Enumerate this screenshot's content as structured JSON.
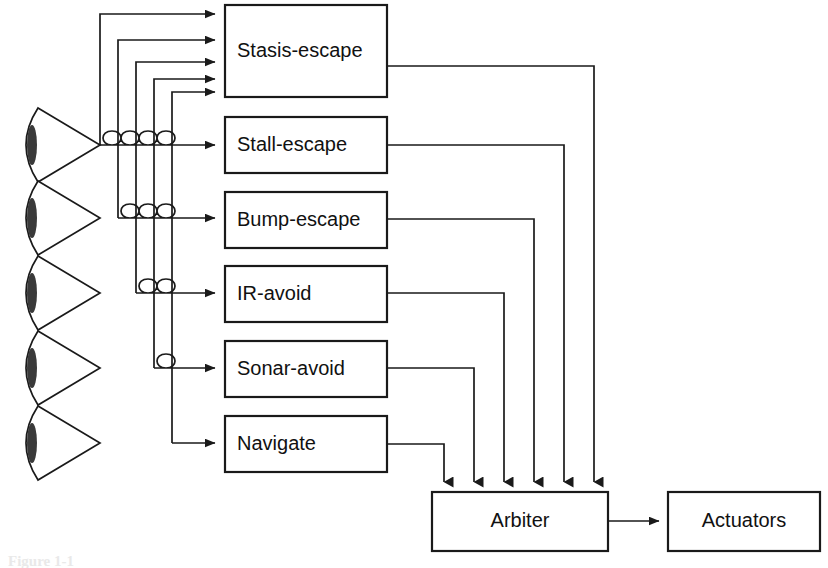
{
  "figure": {
    "background_color": "#ffffff",
    "line_color": "#1a1a1a",
    "text_color": "#111111",
    "width": 828,
    "height": 568
  },
  "behaviors": [
    {
      "id": "stasis-escape",
      "label": "Stasis-escape",
      "x": 225,
      "y": 5,
      "w": 162,
      "h": 92,
      "priority": 1
    },
    {
      "id": "stall-escape",
      "label": "Stall-escape",
      "x": 225,
      "y": 117,
      "w": 162,
      "h": 56,
      "priority": 2
    },
    {
      "id": "bump-escape",
      "label": "Bump-escape",
      "x": 225,
      "y": 192,
      "w": 162,
      "h": 56,
      "priority": 3
    },
    {
      "id": "ir-avoid",
      "label": "IR-avoid",
      "x": 225,
      "y": 266,
      "w": 162,
      "h": 56,
      "priority": 4
    },
    {
      "id": "sonar-avoid",
      "label": "Sonar-avoid",
      "x": 225,
      "y": 341,
      "w": 162,
      "h": 56,
      "priority": 5
    },
    {
      "id": "navigate",
      "label": "Navigate",
      "x": 225,
      "y": 416,
      "w": 162,
      "h": 56,
      "priority": 6
    }
  ],
  "arbiter": {
    "label": "Arbiter",
    "x": 432,
    "y": 492,
    "w": 176,
    "h": 59,
    "input_count": 6,
    "input_arrow_x": [
      444,
      474,
      504,
      534,
      564,
      594
    ]
  },
  "actuators": {
    "label": "Actuators",
    "x": 668,
    "y": 492,
    "w": 152,
    "h": 59
  },
  "sensors": [
    {
      "id": "sensor-1",
      "apex_y": 145,
      "feeds": "stall-escape"
    },
    {
      "id": "sensor-2",
      "apex_y": 218,
      "feeds": "bump-escape"
    },
    {
      "id": "sensor-3",
      "apex_y": 293,
      "feeds": "ir-avoid"
    },
    {
      "id": "sensor-4",
      "apex_y": 368,
      "feeds": "sonar-avoid"
    },
    {
      "id": "sensor-5",
      "apex_y": 443,
      "feeds": "navigate"
    }
  ],
  "sensor_bus": {
    "riser_x": [
      100,
      118,
      136,
      154,
      172
    ],
    "stasis_entry_y": [
      14,
      40,
      62,
      79,
      92
    ]
  },
  "output_bus": {
    "drop_x": [
      594,
      564,
      534,
      504,
      474,
      444
    ],
    "output_y": [
      66,
      145,
      219,
      293,
      368,
      444
    ]
  },
  "caption": {
    "ghost_text": "Figure 1-1"
  }
}
